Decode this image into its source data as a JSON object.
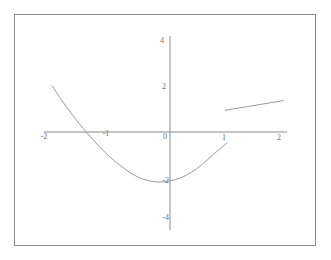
{
  "figure": {
    "title": "",
    "background_color": "#ffffff",
    "frame_color": "#8a8a8a",
    "axis_color": "#8a8a8a",
    "curve_color": "#9a9a9a",
    "label_color": "#6e6e6e"
  },
  "chart_data": {
    "type": "line",
    "title": "",
    "xlabel": "",
    "ylabel": "",
    "xlim": [
      -2.33,
      2.17
    ],
    "ylim": [
      -4.0,
      4.0
    ],
    "grid": false,
    "legend": "none",
    "x_ticks": [
      -2,
      -1,
      0,
      1,
      2
    ],
    "x_tick_labels": [
      "-2",
      "-1",
      "0",
      "1",
      "2"
    ],
    "y_ticks": [
      -4,
      -2,
      2,
      4
    ],
    "y_tick_labels": [
      "-4",
      "-2",
      "2",
      "4"
    ],
    "origin_label": "0",
    "series": [
      {
        "name": "parabola",
        "type": "line",
        "x_range": [
          -2.17,
          1.05
        ],
        "expression_form": "upward parabola with vertex near (-0.55, -2.1)",
        "points": [
          {
            "x": -2.17,
            "y": 1.95
          },
          {
            "x": -2.0,
            "y": 1.35
          },
          {
            "x": -1.8,
            "y": 0.72
          },
          {
            "x": -1.6,
            "y": 0.15
          },
          {
            "x": -1.4,
            "y": -0.38
          },
          {
            "x": -1.2,
            "y": -0.86
          },
          {
            "x": -1.0,
            "y": -1.27
          },
          {
            "x": -0.8,
            "y": -1.62
          },
          {
            "x": -0.6,
            "y": -1.9
          },
          {
            "x": -0.4,
            "y": -2.06
          },
          {
            "x": -0.2,
            "y": -2.12
          },
          {
            "x": 0.0,
            "y": -2.07
          },
          {
            "x": 0.2,
            "y": -1.94
          },
          {
            "x": 0.4,
            "y": -1.7
          },
          {
            "x": 0.6,
            "y": -1.36
          },
          {
            "x": 0.8,
            "y": -0.95
          },
          {
            "x": 1.05,
            "y": -0.47
          }
        ]
      },
      {
        "name": "short-segment",
        "type": "line",
        "x_range": [
          1.02,
          2.09
        ],
        "points": [
          {
            "x": 1.02,
            "y": 0.92
          },
          {
            "x": 2.09,
            "y": 1.33
          }
        ]
      }
    ]
  }
}
